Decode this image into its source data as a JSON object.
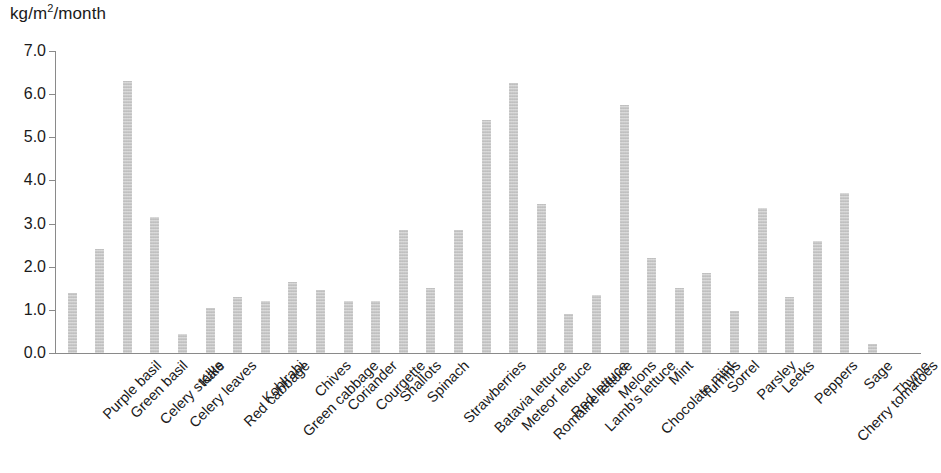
{
  "chart_data": {
    "type": "bar",
    "title": "",
    "subtitle": "",
    "xlabel": "",
    "ylabel": "kg/m2/month",
    "ylabel_display": "kg/m",
    "ylabel_sup": "2",
    "ylabel_tail": "/month",
    "ylim": [
      0.0,
      7.0
    ],
    "ytick_step": 1.0,
    "ytick_labels": [
      "0.0",
      "1.0",
      "2.0",
      "3.0",
      "4.0",
      "5.0",
      "6.0",
      "7.0"
    ],
    "ytick_values": [
      0.0,
      1.0,
      2.0,
      3.0,
      4.0,
      5.0,
      6.0,
      7.0
    ],
    "grid": false,
    "legend": null,
    "bar_color": "#c9c9c9",
    "axis_color": "#8a8a8a",
    "text_color": "#1a1a1a",
    "categories": [
      "Purple basil",
      "Green basil",
      "Celery stalks",
      "Celery leaves",
      "Kale",
      "Red cabbage",
      "Kohlrabi",
      "Green cabbage",
      "Chives",
      "Coriander",
      "Courgette",
      "Shallots",
      "Spinach",
      "Strawberries",
      "Batavia lettuce",
      "Meteor lettuce",
      "Romaine lettuce",
      "Red lettuce",
      "Lamb's lettuce",
      "Melons",
      "Chocolate mint",
      "Mint",
      "Turnips",
      "Sorrel",
      "Parsley",
      "Leeks",
      "Peppers",
      "Cherry tomatoes",
      "Sage",
      "Thyme"
    ],
    "values": [
      1.4,
      2.4,
      6.3,
      3.15,
      0.45,
      1.05,
      1.3,
      1.2,
      1.65,
      1.45,
      1.2,
      1.2,
      2.85,
      1.5,
      2.85,
      5.4,
      6.25,
      3.45,
      0.9,
      1.35,
      5.75,
      2.2,
      1.5,
      1.85,
      0.98,
      3.35,
      1.3,
      2.6,
      3.7,
      0.2
    ]
  }
}
